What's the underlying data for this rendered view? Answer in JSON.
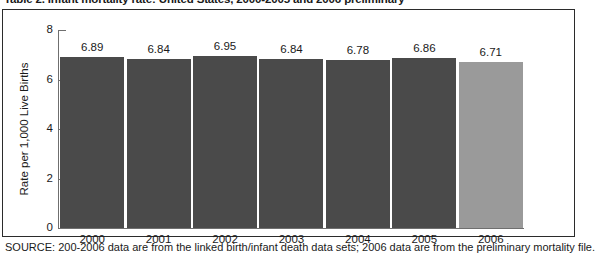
{
  "figure": {
    "title": "Table 2. Infant mortality rate: United States, 2000-2005 and 2006 preliminary",
    "source_note": "SOURCE: 200-2006 data are from the linked birth/infant death data sets; 2006 data are from the preliminary mortality file."
  },
  "colors": {
    "bar_primary": "#4a4a4a",
    "bar_highlight": "#9a9a9a",
    "axis": "#6f6f6f",
    "frame": "#2b2b2b",
    "text": "#1a1a1a",
    "background": "#ffffff"
  },
  "axis": {
    "y_title": "Rate per 1,000 Live Births",
    "y_ticks": [
      "0",
      "2",
      "4",
      "6",
      "8"
    ],
    "x_ticks": [
      "2000",
      "2001",
      "2002",
      "2003",
      "2004",
      "2005",
      "2006"
    ]
  },
  "chart_data": {
    "type": "bar",
    "title": "Table 2. Infant mortality rate: United States, 2000-2005 and 2006 preliminary",
    "xlabel": "",
    "ylabel": "Rate per 1,000 Live Births",
    "ylim": [
      0,
      8
    ],
    "ytick_values": [
      0,
      2,
      4,
      6,
      8
    ],
    "grid": false,
    "legend": "none",
    "categories": [
      "2000",
      "2001",
      "2002",
      "2003",
      "2004",
      "2005",
      "2006"
    ],
    "values": [
      6.89,
      6.84,
      6.95,
      6.84,
      6.78,
      6.86,
      6.71
    ],
    "value_labels": [
      "6.89",
      "6.84",
      "6.95",
      "6.84",
      "6.78",
      "6.86",
      "6.71"
    ],
    "bar_colors": [
      "#4a4a4a",
      "#4a4a4a",
      "#4a4a4a",
      "#4a4a4a",
      "#4a4a4a",
      "#4a4a4a",
      "#9a9a9a"
    ]
  }
}
